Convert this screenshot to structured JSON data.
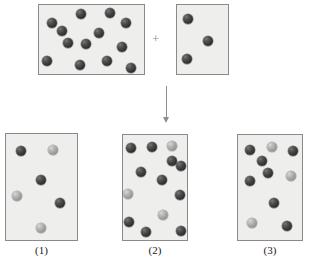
{
  "diagram": {
    "type": "chemical-reaction-particulate-diagram",
    "colors": {
      "box_fill": "#eeeeec",
      "box_border": "#8a8a8a",
      "dark_sphere": "#3c3c3c",
      "light_sphere": "#a2a2a2",
      "connector": "#8f8f8f",
      "caption_text": "#1a1a1a",
      "background": "#ffffff"
    },
    "connectors": {
      "plus_symbol": "+",
      "arrow_symbol": "down-arrow"
    },
    "reactants": [
      {
        "id": "reactant-box-a",
        "rect": [
          38,
          4,
          107,
          71
        ],
        "dark_count": 13,
        "light_count": 0,
        "total_count": 13,
        "spheres": [
          {
            "color": "dark",
            "cx": 52,
            "cy": 23,
            "r": 5.2
          },
          {
            "color": "dark",
            "cx": 81,
            "cy": 14,
            "r": 5.2
          },
          {
            "color": "dark",
            "cx": 110,
            "cy": 13,
            "r": 5.2
          },
          {
            "color": "dark",
            "cx": 126,
            "cy": 23,
            "r": 5.2
          },
          {
            "color": "dark",
            "cx": 99,
            "cy": 33,
            "r": 5.2
          },
          {
            "color": "dark",
            "cx": 68,
            "cy": 43,
            "r": 5.2
          },
          {
            "color": "dark",
            "cx": 86,
            "cy": 44,
            "r": 5.2
          },
          {
            "color": "dark",
            "cx": 122,
            "cy": 47,
            "r": 5.2
          },
          {
            "color": "dark",
            "cx": 47,
            "cy": 61,
            "r": 5.2
          },
          {
            "color": "dark",
            "cx": 80,
            "cy": 65,
            "r": 5.2
          },
          {
            "color": "dark",
            "cx": 107,
            "cy": 61,
            "r": 5.2
          },
          {
            "color": "dark",
            "cx": 131,
            "cy": 68,
            "r": 5.2
          },
          {
            "color": "dark",
            "cx": 62,
            "cy": 31,
            "r": 5.2
          }
        ]
      },
      {
        "id": "reactant-box-b",
        "rect": [
          176,
          4,
          53,
          71
        ],
        "dark_count": 3,
        "light_count": 0,
        "total_count": 3,
        "spheres": [
          {
            "color": "dark",
            "cx": 188,
            "cy": 19,
            "r": 5.2
          },
          {
            "color": "dark",
            "cx": 208,
            "cy": 41,
            "r": 5.2
          },
          {
            "color": "dark",
            "cx": 187,
            "cy": 59,
            "r": 5.2
          }
        ]
      }
    ],
    "products": [
      {
        "id": "product-box-1",
        "label": "(1)",
        "rect": [
          5,
          133,
          73,
          108
        ],
        "dark_count": 3,
        "light_count": 3,
        "total_count": 6,
        "spheres": [
          {
            "color": "dark",
            "cx": 21,
            "cy": 151,
            "r": 5.4
          },
          {
            "color": "light",
            "cx": 53,
            "cy": 150,
            "r": 5.4
          },
          {
            "color": "dark",
            "cx": 41,
            "cy": 180,
            "r": 5.4
          },
          {
            "color": "light",
            "cx": 17,
            "cy": 196,
            "r": 5.4
          },
          {
            "color": "dark",
            "cx": 60,
            "cy": 203,
            "r": 5.4
          },
          {
            "color": "light",
            "cx": 41,
            "cy": 228,
            "r": 5.4
          }
        ]
      },
      {
        "id": "product-box-2",
        "label": "(2)",
        "rect": [
          122,
          134,
          66,
          107
        ],
        "dark_count": 10,
        "light_count": 3,
        "total_count": 13,
        "spheres": [
          {
            "color": "dark",
            "cx": 131,
            "cy": 148,
            "r": 5.4
          },
          {
            "color": "dark",
            "cx": 152,
            "cy": 147,
            "r": 5.4
          },
          {
            "color": "light",
            "cx": 172,
            "cy": 146,
            "r": 5.4
          },
          {
            "color": "dark",
            "cx": 181,
            "cy": 166,
            "r": 5.4
          },
          {
            "color": "dark",
            "cx": 141,
            "cy": 172,
            "r": 5.4
          },
          {
            "color": "dark",
            "cx": 162,
            "cy": 180,
            "r": 5.4
          },
          {
            "color": "light",
            "cx": 128,
            "cy": 194,
            "r": 5.4
          },
          {
            "color": "dark",
            "cx": 180,
            "cy": 195,
            "r": 5.4
          },
          {
            "color": "light",
            "cx": 163,
            "cy": 215,
            "r": 5.4
          },
          {
            "color": "dark",
            "cx": 129,
            "cy": 222,
            "r": 5.4
          },
          {
            "color": "dark",
            "cx": 146,
            "cy": 232,
            "r": 5.4
          },
          {
            "color": "dark",
            "cx": 181,
            "cy": 231,
            "r": 5.4
          },
          {
            "color": "dark",
            "cx": 172,
            "cy": 161,
            "r": 5.4
          }
        ]
      },
      {
        "id": "product-box-3",
        "label": "(3)",
        "rect": [
          237,
          134,
          66,
          107
        ],
        "dark_count": 7,
        "light_count": 3,
        "total_count": 10,
        "spheres": [
          {
            "color": "dark",
            "cx": 250,
            "cy": 150,
            "r": 5.4
          },
          {
            "color": "light",
            "cx": 272,
            "cy": 147,
            "r": 5.4
          },
          {
            "color": "dark",
            "cx": 293,
            "cy": 151,
            "r": 5.4
          },
          {
            "color": "dark",
            "cx": 268,
            "cy": 173,
            "r": 5.4
          },
          {
            "color": "light",
            "cx": 291,
            "cy": 176,
            "r": 5.4
          },
          {
            "color": "dark",
            "cx": 250,
            "cy": 181,
            "r": 5.4
          },
          {
            "color": "dark",
            "cx": 274,
            "cy": 203,
            "r": 5.4
          },
          {
            "color": "light",
            "cx": 252,
            "cy": 223,
            "r": 5.4
          },
          {
            "color": "dark",
            "cx": 287,
            "cy": 226,
            "r": 5.4
          },
          {
            "color": "dark",
            "cx": 262,
            "cy": 161,
            "r": 5.4
          }
        ]
      }
    ]
  }
}
